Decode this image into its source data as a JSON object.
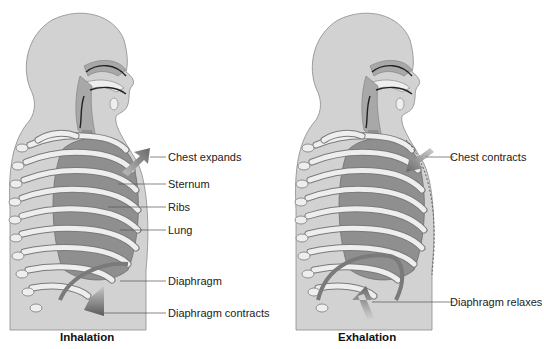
{
  "colors": {
    "body": "#d2d2d2",
    "body_outline": "#8a8a8a",
    "lung": "#8f8f8f",
    "rib": "#eeeeee",
    "rib_outline": "#7a7a7a",
    "airway": "#a8a8a8",
    "arrow": "#707070",
    "leader": "#555555"
  },
  "panels": [
    {
      "id": "inhalation",
      "caption": "Inhalation",
      "labels": [
        {
          "text": "Chest expands"
        },
        {
          "text": "Sternum"
        },
        {
          "text": "Ribs"
        },
        {
          "text": "Lung"
        },
        {
          "text": "Diaphragm"
        },
        {
          "text": "Diaphragm contracts"
        }
      ]
    },
    {
      "id": "exhalation",
      "caption": "Exhalation",
      "labels": [
        {
          "text": "Chest contracts"
        },
        {
          "text": "Diaphragm relaxes"
        }
      ]
    }
  ]
}
